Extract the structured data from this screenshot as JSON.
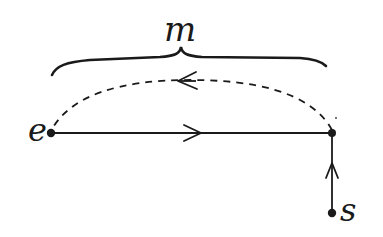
{
  "diagram": {
    "labels": {
      "m": "m",
      "e": "e",
      "s": "s"
    },
    "nodes": [
      {
        "id": "e",
        "x": 51,
        "y": 133
      },
      {
        "id": "junction",
        "x": 332,
        "y": 133
      },
      {
        "id": "s",
        "x": 332,
        "y": 213
      }
    ],
    "edges": [
      {
        "from": "e",
        "to": "junction",
        "style": "solid",
        "arrow": "right"
      },
      {
        "from": "s",
        "to": "junction",
        "style": "solid",
        "arrow": "up"
      },
      {
        "from": "junction",
        "to": "e",
        "style": "dashed-arc",
        "arrow": "left"
      }
    ],
    "brace": {
      "over": [
        "e",
        "junction"
      ],
      "label": "m"
    },
    "colors": {
      "ink": "#1a1a1a",
      "background": "#ffffff"
    }
  }
}
